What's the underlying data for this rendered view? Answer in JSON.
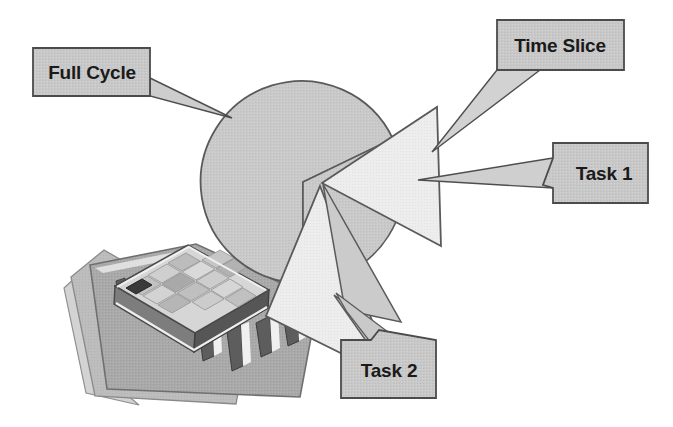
{
  "figure": {
    "background_color": "#ffffff"
  },
  "palette": {
    "pie_body": "#c9c9c9",
    "pie_body_alt": "#cfcfcf",
    "slice_light": "#ebebeb",
    "slice_mid": "#d2d2d2",
    "leader_fill": "#cdcdcd",
    "callout_fill": "#c6c6c6",
    "callout_stroke": "#4b4b4b",
    "outline": "#555555",
    "text": "#1a1a1a",
    "board_top": "#a8a8a8",
    "board_under": "#b6b6b6",
    "board_shadow": "#cfcfcf",
    "chip_top": "#d8d8d8",
    "chip_side": "#6e6e6e",
    "chip_front": "#8a8a8a",
    "pin": "#5d5d5d",
    "pin_light": "#f2f2f2"
  },
  "callouts": [
    {
      "id": "full-cycle",
      "label": "Full Cycle",
      "box": {
        "x": 33,
        "y": 48,
        "w": 117,
        "h": 48
      },
      "text_anchor": {
        "x": 92,
        "y": 79
      },
      "points_to": "pie-body",
      "tail": "right-down"
    },
    {
      "id": "time-slice",
      "label": "Time Slice",
      "box": {
        "x": 497,
        "y": 20,
        "w": 127,
        "h": 50
      },
      "text_anchor": {
        "x": 560,
        "y": 52
      },
      "points_to": "exploded-wedge-gap",
      "tail": "left-down"
    },
    {
      "id": "task-1",
      "label": "Task 1",
      "box": {
        "x": 553,
        "y": 143,
        "w": 95,
        "h": 60
      },
      "text_anchor": {
        "x": 601,
        "y": 180
      },
      "points_to": "slice-task-1",
      "tail": "left"
    },
    {
      "id": "task-2",
      "label": "Task 2",
      "box": {
        "x": 341,
        "y": 340,
        "w": 95,
        "h": 58
      },
      "text_anchor": {
        "x": 389,
        "y": 377
      },
      "points_to": "slice-task-2",
      "tail": "up-left"
    }
  ],
  "pie": {
    "center": {
      "x": 303,
      "y": 182
    },
    "radius": 101,
    "description": "Full cycle disk with a wedge removed; two exploded slices pulled out to the right and below.",
    "slices": [
      {
        "name": "full-cycle-body",
        "label": "Full Cycle",
        "start_deg": 25,
        "end_deg": 300,
        "exploded": false,
        "fill": "#c9c9c9"
      },
      {
        "name": "slice-task-1",
        "label": "Task 1",
        "start_deg": -38,
        "end_deg": 18,
        "exploded": true,
        "fill": "#ebebeb"
      },
      {
        "name": "slice-task-2",
        "label": "Task 2",
        "start_deg": 42,
        "end_deg": 92,
        "exploded": true,
        "fill": "#ebebeb"
      }
    ]
  },
  "chip": {
    "name": "microprocessor-illustration",
    "description": "Integrated-circuit package with pin rows resting on a square substrate board",
    "grid_rows": 4,
    "grid_cols": 5,
    "pin_count": 5
  }
}
